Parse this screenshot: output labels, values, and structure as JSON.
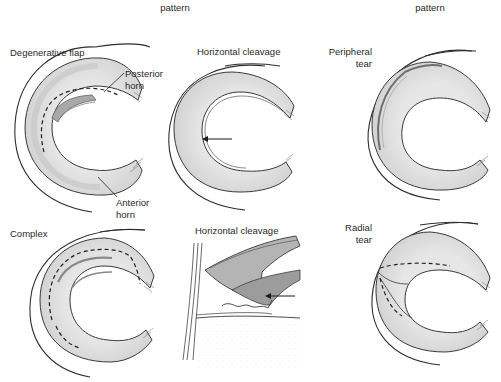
{
  "header": {
    "column_left_caption": "pattern",
    "column_right_caption": "pattern"
  },
  "panels": [
    {
      "id": "degenerative-flap",
      "title": "Degenerative flap",
      "annotations": [
        {
          "text_line1": "Posterior",
          "text_line2": "horn"
        },
        {
          "text_line1": "Anterior",
          "text_line2": "horn"
        }
      ]
    },
    {
      "id": "horizontal-cleavage-top",
      "title": "Horizontal cleavage"
    },
    {
      "id": "peripheral-tear",
      "title_line1": "Peripheral",
      "title_line2": "tear"
    },
    {
      "id": "complex",
      "title": "Complex"
    },
    {
      "id": "horizontal-cleavage-section",
      "title": "Horizontal cleavage"
    },
    {
      "id": "radial-tear",
      "title_line1": "Radial",
      "title_line2": "tear"
    }
  ],
  "colors": {
    "meniscus_fill": "#dcdcdc",
    "meniscus_inner_shade": "#c8c8c8",
    "meniscus_outline": "#3a3a3a",
    "flap_fill": "#a9a9a9",
    "tear_line": "#6f6f6f",
    "capsule_line": "#2e2e2e",
    "arrow": "#1a1a1a",
    "background": "#ffffff"
  }
}
